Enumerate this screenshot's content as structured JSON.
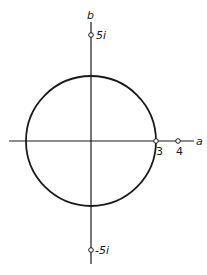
{
  "diagram": {
    "axes": {
      "horizontal_label": "a",
      "vertical_label": "b"
    },
    "circle": {
      "center": [
        0,
        0
      ],
      "radius": 3
    },
    "points": [
      {
        "id": "p5i",
        "label": "5i",
        "position": "imaginary +5"
      },
      {
        "id": "pm5i",
        "label": "-5i",
        "position": "imaginary -5"
      },
      {
        "id": "p3",
        "label": "3",
        "position": "real 3"
      },
      {
        "id": "p4",
        "label": "4",
        "position": "real 4"
      }
    ],
    "colors": {
      "stroke": "#1a1a1a",
      "background": "#ffffff"
    }
  }
}
